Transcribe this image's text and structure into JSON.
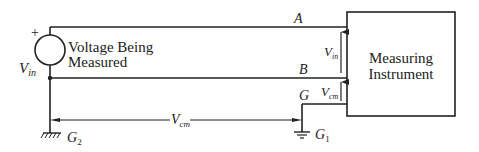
{
  "diagram": {
    "source": {
      "label_line1": "Voltage Being",
      "label_line2": "Measured",
      "polarity": "+",
      "voltage_symbol": "V",
      "voltage_sub": "in"
    },
    "instrument": {
      "label_line1": "Measuring",
      "label_line2": "Instrument"
    },
    "nodes": {
      "a": "A",
      "b": "B",
      "g": "G"
    },
    "grounds": {
      "g2_main": "G",
      "g2_sub": "2",
      "g1_main": "G",
      "g1_sub": "1"
    },
    "voltages": {
      "vin_main": "V",
      "vin_sub": "in",
      "vcm_main": "V",
      "vcm_sub": "cm",
      "vcm_between_main": "V",
      "vcm_between_sub": "cm"
    },
    "colors": {
      "line": "#222222",
      "background": "#ffffff"
    }
  }
}
